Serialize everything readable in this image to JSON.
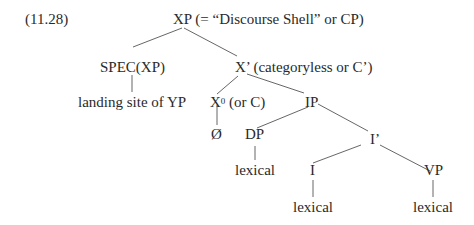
{
  "example_number": "(11.28)",
  "nodes": {
    "xp": "XP (= “Discourse Shell” or CP)",
    "spec_xp": "SPEC(XP)",
    "x_bar": "X’ (categoryless or C’)",
    "landing_site": "landing site of YP",
    "x0_base": "X",
    "x0_sup": "0",
    "x0_rest": " (or C)",
    "ip": "IP",
    "empty": "Ø",
    "dp": "DP",
    "i_bar": "I’",
    "dp_lexical": "lexical",
    "i": "I",
    "vp": "VP",
    "i_lexical": "lexical",
    "vp_lexical": "lexical"
  }
}
